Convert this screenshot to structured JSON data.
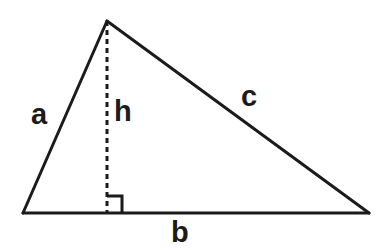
{
  "figure": {
    "kind": "geometry-diagram",
    "shape": "triangle",
    "background_color": "#ffffff",
    "stroke_color": "#1b1b1b",
    "label_color": "#1b1b1b"
  },
  "geometry": {
    "vertices": {
      "apex": {
        "x": 107,
        "y": 21
      },
      "bottom_left": {
        "x": 23,
        "y": 213
      },
      "bottom_right": {
        "x": 369,
        "y": 213
      }
    },
    "altitude_foot": {
      "x": 107,
      "y": 213
    },
    "solid_stroke_width": 3,
    "dashed_stroke_width": 3,
    "dash_pattern": "5 4",
    "right_angle_marker": {
      "size": 15,
      "corner_x": 107,
      "corner_y": 213,
      "opens": "right"
    }
  },
  "labels": {
    "side_a": "a",
    "height_h": "h",
    "side_c": "c",
    "base_b": "b"
  }
}
